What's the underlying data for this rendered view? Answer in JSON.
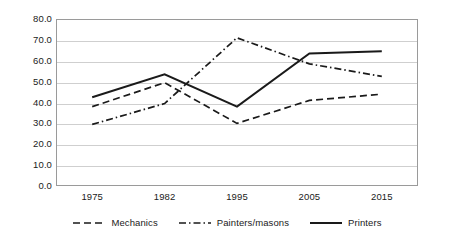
{
  "chart_data": {
    "type": "line",
    "title": "",
    "xlabel": "",
    "ylabel": "",
    "categories": [
      "1975",
      "1982",
      "1995",
      "2005",
      "2015"
    ],
    "ylim": [
      0,
      80
    ],
    "yticks": [
      "0.0",
      "10.0",
      "20.0",
      "30.0",
      "40.0",
      "50.0",
      "60.0",
      "70.0",
      "80.0"
    ],
    "ytick_values": [
      0,
      10,
      20,
      30,
      40,
      50,
      60,
      70,
      80
    ],
    "grid": true,
    "legend_position": "bottom",
    "series": [
      {
        "name": "Mechanics",
        "style": "dashed",
        "color": "#1a1a1a",
        "values": [
          38.0,
          49.5,
          30.0,
          41.0,
          44.0
        ]
      },
      {
        "name": "Painters/masons",
        "style": "dash-dot",
        "color": "#1a1a1a",
        "values": [
          29.5,
          39.5,
          71.0,
          58.5,
          52.5
        ]
      },
      {
        "name": "Printers",
        "style": "solid",
        "color": "#1a1a1a",
        "values": [
          42.5,
          53.5,
          38.0,
          63.5,
          64.5
        ]
      }
    ]
  },
  "colors": {
    "background": "#ffffff",
    "gridline": "#cfcfcf",
    "frame": "#9a9a9a",
    "text": "#1a1a1a",
    "series": "#1a1a1a"
  }
}
